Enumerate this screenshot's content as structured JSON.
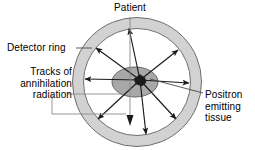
{
  "diagram": {
    "labels": {
      "patient": "Patient",
      "detector_ring": "Detector ring",
      "tracks_line1": "Tracks of",
      "tracks_line2": "annihilation",
      "tracks_line3": "radiation",
      "positron_line1": "Positron",
      "positron_line2": "emitting",
      "positron_line3": "tissue"
    },
    "colors": {
      "ring_fill": "#d2d2d2",
      "ring_stroke": "#6e6e6e",
      "tissue_fill": "#a8a8a8",
      "tissue_stroke": "#5a5a5a",
      "source_fill": "#1a1a1a",
      "track_stroke": "#1a1a1a",
      "leader_stroke": "#808080",
      "text": "#000000",
      "background": "#ffffff"
    },
    "geometry": {
      "center_x": 137,
      "center_y": 82,
      "outer_radius": 65,
      "inner_radius": 54,
      "tissue_cx": 135,
      "tissue_cy": 82,
      "tissue_rx": 23,
      "tissue_ry": 15,
      "source_x": 140,
      "source_y": 80
    },
    "tracks": [
      {
        "name": "track-up",
        "angle_deg": 102
      },
      {
        "name": "track-upper-left",
        "angle_deg": 147
      },
      {
        "name": "track-left",
        "angle_deg": 180
      },
      {
        "name": "track-lower-left",
        "angle_deg": 217
      },
      {
        "name": "track-down",
        "angle_deg": 268
      },
      {
        "name": "track-lower-right",
        "angle_deg": 312
      },
      {
        "name": "track-right",
        "angle_deg": 358
      },
      {
        "name": "track-upper-right",
        "angle_deg": 38
      }
    ]
  }
}
